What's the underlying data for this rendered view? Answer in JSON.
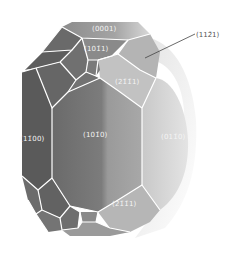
{
  "diagram": {
    "type": "crystal-morphology",
    "colors": {
      "background": "#ffffff",
      "edge": "#ffffff",
      "face_dark": "#5e5e5e",
      "face_mid_dark": "#6f6f6f",
      "face_mid": "#8a8a8a",
      "face_light": "#b8b8b8",
      "face_lighter": "#d2d2d2",
      "face_lightest": "#e6e6e6",
      "callout_line": "#444444",
      "label_text": "#f4f4f4",
      "callout_text": "#555555"
    },
    "faces": [
      {
        "id": "0001",
        "label": "(0001)"
      },
      {
        "id": "10-11",
        "label": "(101̄1)"
      },
      {
        "id": "1-100",
        "label": "(11̄00)"
      },
      {
        "id": "10-10",
        "label": "(101̄0)"
      },
      {
        "id": "01-10",
        "label": "(011̄0)"
      },
      {
        "id": "2-1-11-upper",
        "label": "(21̄1̄1)"
      },
      {
        "id": "2-1-11-lower",
        "label": "(21̄1̄1)"
      }
    ],
    "callouts": [
      {
        "id": "11-21",
        "label": "(112̄1)"
      }
    ]
  }
}
